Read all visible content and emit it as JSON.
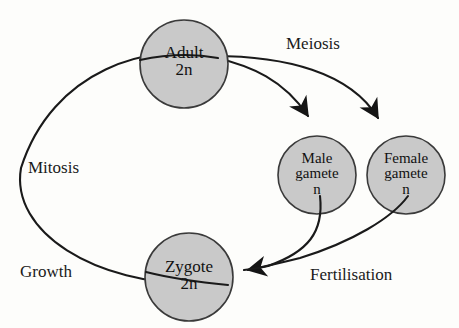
{
  "figure": {
    "kind": "life-cycle-diagram",
    "background_color": "#fdfdfb",
    "node_fill_color": "#c9c9c9",
    "node_stroke_color": "#3a3a3a",
    "line_color": "#1a1a1a",
    "text_color": "#111111"
  },
  "nodes": [
    {
      "id": "adult",
      "name": "Adult",
      "ploidy": "2n",
      "cx": 184,
      "cy": 64,
      "r": 44
    },
    {
      "id": "male",
      "name": "Male",
      "name2": "gamete",
      "ploidy": "n",
      "cx": 317,
      "cy": 175,
      "r": 39
    },
    {
      "id": "female",
      "name": "Female",
      "name2": "gamete",
      "ploidy": "n",
      "cx": 406,
      "cy": 175,
      "r": 39
    },
    {
      "id": "zygote",
      "name": "Zygote",
      "ploidy": "2n",
      "cx": 189,
      "cy": 277,
      "r": 44
    }
  ],
  "edges": [
    {
      "id": "meiosis-male",
      "label": "Meiosis",
      "from": "adult",
      "to": "male",
      "arrow": true
    },
    {
      "id": "meiosis-female",
      "label": "Meiosis",
      "from": "adult",
      "to": "female",
      "arrow": true
    },
    {
      "id": "fert-male",
      "label": "Fertilisation",
      "from": "male",
      "to": "zygote",
      "arrow": true
    },
    {
      "id": "fert-female",
      "label": "Fertilisation",
      "from": "female",
      "to": "zygote",
      "arrow": true
    },
    {
      "id": "growth",
      "label": "Growth",
      "from": "zygote",
      "to": "adult",
      "arrow": false
    },
    {
      "id": "mitosis",
      "label": "Mitosis",
      "from": "zygote",
      "to": "adult",
      "arrow": false
    }
  ],
  "labels": {
    "meiosis": "Meiosis",
    "mitosis": "Mitosis",
    "growth": "Growth",
    "fertilisation": "Fertilisation"
  },
  "node_text": {
    "adult": {
      "name": "Adult",
      "ploidy": "2n"
    },
    "zygote": {
      "name": "Zygote",
      "ploidy": "2n"
    },
    "male": {
      "line1": "Male",
      "line2": "gamete",
      "line3": "n"
    },
    "female": {
      "line1": "Female",
      "line2": "gamete",
      "line3": "n"
    }
  }
}
